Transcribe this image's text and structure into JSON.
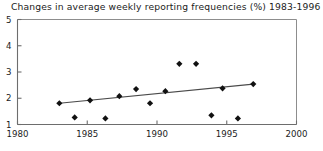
{
  "chart_data": {
    "type": "scatter",
    "title": "Changes in average weekly reporting frequencies (%) 1983-1996",
    "xlabel": "",
    "ylabel": "",
    "xlim": [
      1980,
      2000
    ],
    "ylim": [
      1,
      5
    ],
    "xticks": [
      1980,
      1985,
      1990,
      1995,
      2000
    ],
    "yticks": [
      1,
      2,
      3,
      4,
      5
    ],
    "xtick_labels": [
      "1980",
      "1985",
      "1990",
      "1995",
      "2000"
    ],
    "ytick_labels": [
      "1",
      "2",
      "3",
      "4",
      "5"
    ],
    "grid": false,
    "legend": null,
    "marker": "filled-diamond",
    "marker_color": "#111111",
    "trend_line_color": "#4a4a4a",
    "series": [
      {
        "name": "Average weekly reporting frequency",
        "x": [
          1983.0,
          1984.1,
          1985.2,
          1986.3,
          1987.3,
          1988.5,
          1989.5,
          1990.6,
          1991.6,
          1992.8,
          1993.9,
          1994.7,
          1995.8,
          1996.9
        ],
        "y": [
          1.81,
          1.27,
          1.92,
          1.23,
          2.08,
          2.35,
          1.81,
          2.27,
          3.31,
          3.31,
          1.35,
          2.38,
          1.23,
          2.54
        ]
      }
    ],
    "trend_line": {
      "name": "Linear trend",
      "x": [
        1983.0,
        1996.9
      ],
      "y": [
        1.81,
        2.54
      ]
    }
  }
}
